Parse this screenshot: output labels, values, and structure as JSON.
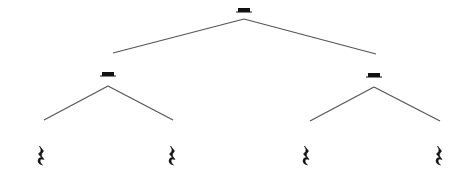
{
  "diagram": {
    "type": "tree",
    "line_color": "#555555",
    "symbol_color": "#111111",
    "nodes": [
      {
        "id": "root",
        "symbol": "half-rest",
        "x": 244,
        "y": 9
      },
      {
        "id": "mid-left",
        "symbol": "half-rest",
        "x": 108,
        "y": 73
      },
      {
        "id": "mid-right",
        "symbol": "half-rest",
        "x": 374,
        "y": 74
      },
      {
        "id": "leaf-1",
        "symbol": "quarter-rest",
        "x": 41,
        "y": 156
      },
      {
        "id": "leaf-2",
        "symbol": "quarter-rest",
        "x": 172,
        "y": 156
      },
      {
        "id": "leaf-3",
        "symbol": "quarter-rest",
        "x": 306,
        "y": 156
      },
      {
        "id": "leaf-4",
        "symbol": "quarter-rest",
        "x": 439,
        "y": 156
      }
    ],
    "edges": [
      {
        "from": "root",
        "to": "mid-left",
        "x1": 244,
        "y1": 19,
        "x2": 113,
        "y2": 53
      },
      {
        "from": "root",
        "to": "mid-right",
        "x1": 244,
        "y1": 19,
        "x2": 376,
        "y2": 54
      },
      {
        "from": "mid-left",
        "to": "leaf-1",
        "x1": 108,
        "y1": 86,
        "x2": 44,
        "y2": 120
      },
      {
        "from": "mid-left",
        "to": "leaf-2",
        "x1": 108,
        "y1": 86,
        "x2": 173,
        "y2": 120
      },
      {
        "from": "mid-right",
        "to": "leaf-3",
        "x1": 374,
        "y1": 87,
        "x2": 310,
        "y2": 121
      },
      {
        "from": "mid-right",
        "to": "leaf-4",
        "x1": 374,
        "y1": 87,
        "x2": 440,
        "y2": 121
      }
    ]
  }
}
